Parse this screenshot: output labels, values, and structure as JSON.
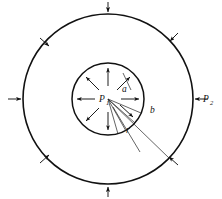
{
  "figure": {
    "labels": {
      "inner_pressure": "P",
      "inner_pressure_sub": "1",
      "outer_pressure": "P",
      "outer_pressure_sub": "2",
      "inner_radius": "a",
      "outer_radius": "b",
      "variable_radius": "r"
    },
    "colors": {
      "stroke": "#111111",
      "thin_stroke": "#222222",
      "background": "#ffffff"
    },
    "geometry": {
      "center_x": 108,
      "center_y": 99,
      "outer_radius_px": 85,
      "inner_radius_px": 36
    },
    "external_arrow_count": 8,
    "internal_arrow_count": 8,
    "fan_line_count": 5
  }
}
